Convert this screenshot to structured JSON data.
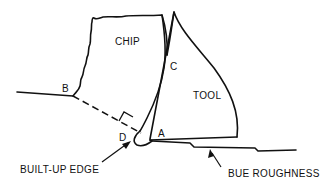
{
  "diagram": {
    "type": "metal-cutting schematic",
    "regions": {
      "chip": "CHIP",
      "tool": "TOOL"
    },
    "points": {
      "a": "A",
      "b": "B",
      "c": "C",
      "d": "D"
    },
    "callouts": {
      "built_up_edge": "BUILT-UP EDGE",
      "bue_roughness": "BUE ROUGHNESS"
    },
    "colors": {
      "line": "#111111",
      "background": "#ffffff"
    }
  }
}
